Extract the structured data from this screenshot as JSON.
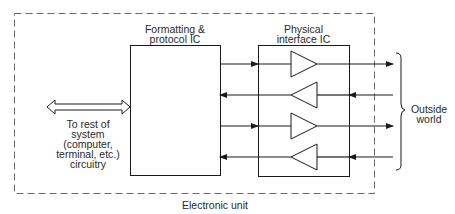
{
  "diagram": {
    "outer_box": {
      "label": "Electronic unit",
      "style": "dashed"
    },
    "formatting_ic": {
      "label_line1": "Formatting &",
      "label_line2": "protocol IC"
    },
    "physical_ic": {
      "label_line1": "Physical",
      "label_line2": "interface IC"
    },
    "system_link": {
      "label_line1": "To rest of",
      "label_line2": "system",
      "label_line3": "(computer,",
      "label_line4": "terminal, etc.)",
      "label_line5": "circuitry",
      "arrow": "bidirectional"
    },
    "outside": {
      "label_line1": "Outside",
      "label_line2": "world"
    },
    "signal_lines": [
      {
        "direction": "out",
        "buffer": "driver"
      },
      {
        "direction": "in",
        "buffer": "receiver"
      },
      {
        "direction": "out",
        "buffer": "driver"
      },
      {
        "direction": "in",
        "buffer": "receiver"
      }
    ],
    "colors": {
      "line": "#1a1a1a",
      "dashed": "#6a6a6a",
      "text": "#2a2a2a",
      "background": "#ffffff"
    }
  }
}
